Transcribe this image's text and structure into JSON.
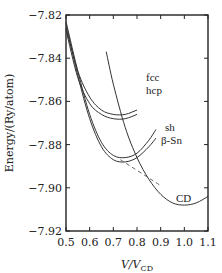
{
  "chart_data": {
    "type": "line",
    "title": "",
    "xlabel": "V/V_CD",
    "xlabel_main": "V/V",
    "xlabel_sub": "CD",
    "ylabel": "Energy/(Ry/atom)",
    "xlim": [
      0.5,
      1.1
    ],
    "ylim": [
      -7.92,
      -7.82
    ],
    "xticks": [
      0.5,
      0.6,
      0.7,
      0.8,
      0.9,
      1.0,
      1.1
    ],
    "xtick_labels": [
      "0.5",
      "0.6",
      "0.7",
      "0.8",
      "0.9",
      "1.0",
      "1.1"
    ],
    "yticks": [
      -7.82,
      -7.84,
      -7.86,
      -7.88,
      -7.9,
      -7.92
    ],
    "ytick_labels": [
      "−7.82",
      "−7.84",
      "−7.86",
      "−7.88",
      "−7.90",
      "−7.92"
    ],
    "grid": false,
    "legend": "inline labels",
    "series": [
      {
        "name": "fcc",
        "x": [
          0.5,
          0.55,
          0.6,
          0.65,
          0.7,
          0.75,
          0.8
        ],
        "y": [
          -7.826,
          -7.846,
          -7.858,
          -7.864,
          -7.866,
          -7.866,
          -7.864
        ]
      },
      {
        "name": "hcp",
        "x": [
          0.5,
          0.55,
          0.6,
          0.65,
          0.7,
          0.75,
          0.8
        ],
        "y": [
          -7.827,
          -7.849,
          -7.861,
          -7.866,
          -7.868,
          -7.868,
          -7.866
        ]
      },
      {
        "name": "sh",
        "x": [
          0.5,
          0.55,
          0.6,
          0.65,
          0.7,
          0.75,
          0.8,
          0.85,
          0.88
        ],
        "y": [
          -7.823,
          -7.846,
          -7.866,
          -7.879,
          -7.885,
          -7.886,
          -7.884,
          -7.878,
          -7.873
        ]
      },
      {
        "name": "β-Sn",
        "x": [
          0.5,
          0.55,
          0.6,
          0.65,
          0.7,
          0.75,
          0.8,
          0.85,
          0.88
        ],
        "y": [
          -7.824,
          -7.848,
          -7.868,
          -7.881,
          -7.887,
          -7.888,
          -7.886,
          -7.881,
          -7.877
        ]
      },
      {
        "name": "CD",
        "x": [
          0.67,
          0.7,
          0.75,
          0.8,
          0.85,
          0.9,
          0.95,
          1.0,
          1.05,
          1.1
        ],
        "y": [
          -7.837,
          -7.852,
          -7.872,
          -7.886,
          -7.896,
          -7.903,
          -7.907,
          -7.908,
          -7.907,
          -7.904
        ]
      },
      {
        "name": "common tangent",
        "style": "dashed",
        "x": [
          0.73,
          0.9
        ],
        "y": [
          -7.887,
          -7.899
        ]
      }
    ]
  }
}
